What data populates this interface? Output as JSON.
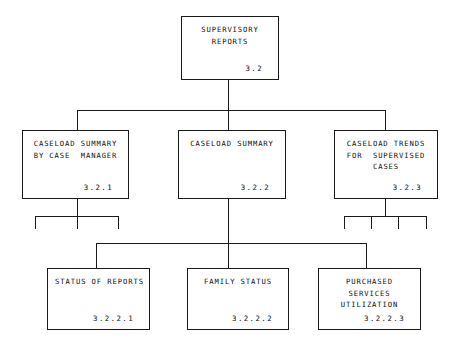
{
  "diagram": {
    "type": "hierarchy-tree",
    "line_color": "#1a1a1a",
    "background_color": "#ffffff",
    "text_color": "#111111"
  },
  "nodes": {
    "root": {
      "lines": [
        "SUPERVISORY",
        "REPORTS"
      ],
      "id": "3.2"
    },
    "level2": [
      {
        "lines": [
          "CASELOAD SUMMARY",
          "BY CASE  MANAGER"
        ],
        "id": "3.2.1",
        "stub_count": 3
      },
      {
        "lines": [
          "CASELOAD SUMMARY"
        ],
        "id": "3.2.2",
        "stub_count": 0
      },
      {
        "lines": [
          "CASELOAD TRENDS",
          "FOR  SUPERVISED",
          "CASES"
        ],
        "id": "3.2.3",
        "stub_count": 4
      }
    ],
    "level3": [
      {
        "lines": [
          "STATUS OF REPORTS"
        ],
        "id": "3.2.2.1"
      },
      {
        "lines": [
          "FAMILY STATUS"
        ],
        "id": "3.2.2.2"
      },
      {
        "lines": [
          "PURCHASED",
          "SERVICES",
          "UTILIZATION"
        ],
        "id": "3.2.2.3"
      }
    ]
  }
}
